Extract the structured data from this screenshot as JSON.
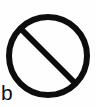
{
  "figure": {
    "panel_label": "b",
    "caption_position": "bottom-left",
    "canvas": {
      "width": 96,
      "height": 107,
      "background_color": "#fefefe"
    },
    "symbol": {
      "name": "prohibition-sign",
      "description": "no-entry circle with diagonal slash",
      "stroke_color": "#0d0d0d",
      "fill_color": "none",
      "circle": {
        "center_x": 48,
        "center_y": 56,
        "radius": 39,
        "stroke_width": 6
      },
      "slash": {
        "x1": 20,
        "y1": 28,
        "x2": 76,
        "y2": 84,
        "stroke_width": 6,
        "direction": "upper-left-to-lower-right"
      }
    }
  }
}
